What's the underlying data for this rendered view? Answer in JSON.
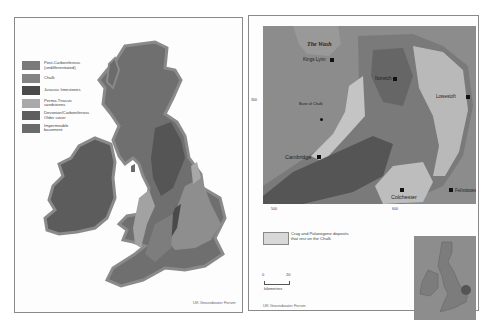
{
  "left_panel": {
    "legend": [
      {
        "label": "Post-Carboniferous\n(undifferentiated)",
        "color": "#7a7a7a"
      },
      {
        "label": "Chalk",
        "color": "#838383"
      },
      {
        "label": "Jurassic limestones",
        "color": "#4a4a4a"
      },
      {
        "label": "Permo-Triassic\nsandstones",
        "color": "#a9a9a9"
      },
      {
        "label": "Devonian/Carboniferous\nOlder cover",
        "color": "#5e5e5e"
      },
      {
        "label": "Impermeable\nbasement",
        "color": "#6b6b6b"
      }
    ],
    "credit": "UK Groundwater Forum"
  },
  "right_panel": {
    "water_label": "The Wash",
    "places": {
      "kings_lynn": "Kings Lynn",
      "norwich": "Norwich",
      "lowestoft": "Lowestoft",
      "cambridge": "Cambridge",
      "felixstowe": "Felixstowe",
      "colchester": "Colchester",
      "base_of_chalk": "Base of Chalk"
    },
    "axis_ticks": {
      "y_left": "300",
      "x_left": "500",
      "x_right": "600"
    },
    "legend_crag": "Crag and Palaeogene deposits\nthat rest on the Chalk",
    "scale": {
      "start": "0",
      "end": "20",
      "unit": "kilometres"
    },
    "credit": "UK Groundwater Forum"
  }
}
